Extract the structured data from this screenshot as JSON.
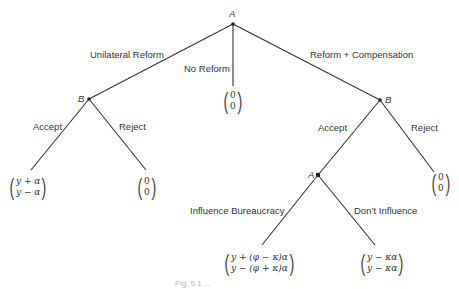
{
  "figure": {
    "nodes": {
      "root": "A",
      "left_decision": "B",
      "right_decision": "B",
      "inner_decision": "A"
    },
    "edges": {
      "unilateral_reform": "Unilateral Reform",
      "no_reform": "No Reform",
      "reform_compensation": "Reform + Compensation",
      "left_accept": "Accept",
      "left_reject": "Reject",
      "right_accept": "Accept",
      "right_reject": "Reject",
      "influence": "Influence Bureaucracy",
      "dont_influence": "Don’t Influence"
    },
    "payoffs": {
      "no_reform": {
        "top": "0",
        "bottom": "0"
      },
      "left_accept": {
        "top": "y + α",
        "bottom": "y − α"
      },
      "left_reject": {
        "top": "0",
        "bottom": "0"
      },
      "right_reject": {
        "top": "0",
        "bottom": "0"
      },
      "influence": {
        "top": "y + (φ − κ)α",
        "bottom": "y − (φ + κ)α"
      },
      "dont_influence": {
        "top": "y − κα",
        "bottom": "y − κα"
      }
    },
    "caption": "Fig. 5.1 ..."
  }
}
